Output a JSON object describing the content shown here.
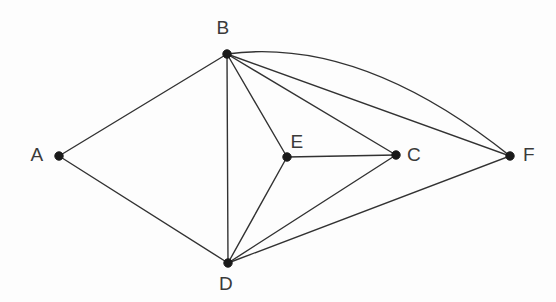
{
  "diagram": {
    "type": "undirected-graph",
    "background_color": "#fdfdfd",
    "edge_color": "#323232",
    "vertex_color": "#1a1a1a",
    "label_color": "#3a3a3a",
    "canvas": {
      "width": 556,
      "height": 302
    }
  },
  "vertices": [
    {
      "id": "A",
      "label": "A",
      "x": 59,
      "y": 156,
      "label_x": 37,
      "label_y": 156
    },
    {
      "id": "B",
      "label": "B",
      "x": 227,
      "y": 54,
      "label_x": 223,
      "label_y": 29
    },
    {
      "id": "C",
      "label": "C",
      "x": 396,
      "y": 155,
      "label_x": 414,
      "label_y": 156
    },
    {
      "id": "D",
      "label": "D",
      "x": 228,
      "y": 263,
      "label_x": 226,
      "label_y": 285
    },
    {
      "id": "E",
      "label": "E",
      "x": 287,
      "y": 157,
      "label_x": 297,
      "label_y": 143
    },
    {
      "id": "F",
      "label": "F",
      "x": 510,
      "y": 156,
      "label_x": 529,
      "label_y": 156
    }
  ],
  "edges": [
    {
      "id": "A-B",
      "from": "A",
      "to": "B",
      "shape": "straight"
    },
    {
      "id": "A-D",
      "from": "A",
      "to": "D",
      "shape": "straight"
    },
    {
      "id": "B-D",
      "from": "B",
      "to": "D",
      "shape": "straight"
    },
    {
      "id": "B-E",
      "from": "B",
      "to": "E",
      "shape": "straight"
    },
    {
      "id": "B-C",
      "from": "B",
      "to": "C",
      "shape": "straight"
    },
    {
      "id": "B-F",
      "from": "B",
      "to": "F",
      "shape": "straight"
    },
    {
      "id": "B-F-arc",
      "from": "B",
      "to": "F",
      "shape": "curved",
      "curve_control_x": 360,
      "curve_control_y": 36
    },
    {
      "id": "D-E",
      "from": "D",
      "to": "E",
      "shape": "straight"
    },
    {
      "id": "D-C",
      "from": "D",
      "to": "C",
      "shape": "straight"
    },
    {
      "id": "D-F",
      "from": "D",
      "to": "F",
      "shape": "straight"
    },
    {
      "id": "E-C",
      "from": "E",
      "to": "C",
      "shape": "straight"
    }
  ],
  "counts": {
    "vertices": 6,
    "edges": 11
  }
}
